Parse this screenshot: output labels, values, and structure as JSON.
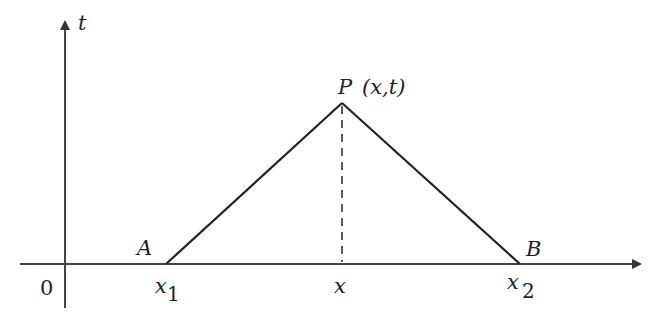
{
  "diagram": {
    "axes": {
      "vertical_label": "t",
      "origin_label": "0"
    },
    "points": {
      "A": {
        "label": "A",
        "position_label": "x",
        "position_subscript": "1"
      },
      "P": {
        "label": "P",
        "coords": "(x,t)"
      },
      "B": {
        "label": "B",
        "position_label": "x",
        "position_subscript": "2"
      }
    },
    "foot_label": "x",
    "colors": {
      "stroke": "#222222",
      "background": "#ffffff"
    }
  }
}
